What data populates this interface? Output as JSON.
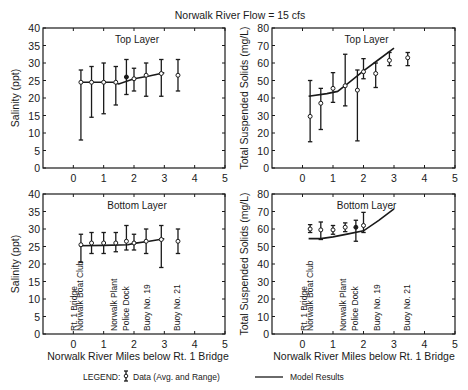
{
  "figure": {
    "title": "Norwalk River Flow = 15 cfs",
    "xlabel": "Norwalk River Miles below Rt. 1 Bridge",
    "legend": {
      "label": "LEGEND:",
      "data_label": "Data (Avg. and Range)",
      "model_label": "Model Results"
    },
    "location_labels": [
      {
        "text": "Rt. 1 Bridge",
        "x": 0.0
      },
      {
        "text": "Norwalk Boat Club",
        "x": 0.2
      },
      {
        "text": "Norwalk Plant",
        "x": 1.3
      },
      {
        "text": "Police Dock",
        "x": 1.7
      },
      {
        "text": "Buoy No. 19",
        "x": 2.4
      },
      {
        "text": "Buoy No. 21",
        "x": 3.4
      }
    ]
  },
  "chart_data": [
    {
      "id": "top-salinity",
      "type": "line",
      "title": "Top Layer",
      "xlabel": "",
      "ylabel": "Salinity (ppt)",
      "xlim": [
        -1,
        5
      ],
      "ylim": [
        0,
        40
      ],
      "xticks": [
        0,
        1,
        2,
        3,
        4,
        5
      ],
      "yticks": [
        0,
        5,
        10,
        15,
        20,
        25,
        30,
        35,
        40
      ],
      "series": [
        {
          "name": "Data (Avg. and Range)",
          "kind": "errorbar",
          "points": [
            {
              "x": 0.25,
              "avg": 24.5,
              "min": 8.0,
              "max": 28.0
            },
            {
              "x": 0.6,
              "avg": 24.5,
              "min": 14.5,
              "max": 29.0
            },
            {
              "x": 1.0,
              "avg": 24.5,
              "min": 15.5,
              "max": 30.0
            },
            {
              "x": 1.4,
              "avg": 24.5,
              "min": 18.0,
              "max": 29.0
            },
            {
              "x": 1.75,
              "avg": 26.0,
              "min": 21.0,
              "max": 31.0,
              "filled": true
            },
            {
              "x": 2.0,
              "avg": 25.5,
              "min": 22.0,
              "max": 28.5
            },
            {
              "x": 2.4,
              "avg": 26.5,
              "min": 20.5,
              "max": 30.0
            },
            {
              "x": 2.9,
              "avg": 27.0,
              "min": 20.5,
              "max": 31.0
            },
            {
              "x": 3.45,
              "avg": 26.5,
              "min": 22.0,
              "max": 31.0
            }
          ]
        },
        {
          "name": "Model Results",
          "kind": "line",
          "x": [
            0.2,
            1.3,
            1.5,
            2.0,
            2.5,
            3.0
          ],
          "y": [
            24.5,
            24.5,
            24.0,
            25.5,
            26.3,
            27.2
          ]
        }
      ]
    },
    {
      "id": "top-tss",
      "type": "line",
      "title": "Top Layer",
      "xlabel": "",
      "ylabel": "Total Suspended Solids (mg/L)",
      "xlim": [
        -1,
        5
      ],
      "ylim": [
        0,
        80
      ],
      "xticks": [
        0,
        1,
        2,
        3,
        4,
        5
      ],
      "yticks": [
        0,
        10,
        20,
        30,
        40,
        50,
        60,
        70,
        80
      ],
      "series": [
        {
          "name": "Data (Avg. and Range)",
          "kind": "errorbar",
          "points": [
            {
              "x": 0.25,
              "avg": 29.5,
              "min": 15.0,
              "max": 50.0
            },
            {
              "x": 0.6,
              "avg": 37.0,
              "min": 22.0,
              "max": 45.5
            },
            {
              "x": 1.0,
              "avg": 45.5,
              "min": 37.5,
              "max": 54.5
            },
            {
              "x": 1.4,
              "avg": 47.0,
              "min": 35.5,
              "max": 65.0
            },
            {
              "x": 1.8,
              "avg": 44.5,
              "min": 15.5,
              "max": 56.0
            },
            {
              "x": 2.0,
              "avg": 55.0,
              "min": 51.0,
              "max": 62.5
            },
            {
              "x": 2.4,
              "avg": 54.0,
              "min": 46.0,
              "max": 60.0
            },
            {
              "x": 2.85,
              "avg": 61.5,
              "min": 58.5,
              "max": 66.0
            },
            {
              "x": 3.45,
              "avg": 63.0,
              "min": 58.5,
              "max": 66.0
            }
          ]
        },
        {
          "name": "Model Results",
          "kind": "line",
          "x": [
            0.2,
            0.8,
            1.15,
            1.5,
            2.0,
            2.5,
            3.0
          ],
          "y": [
            41.0,
            42.5,
            43.8,
            48.5,
            55.5,
            62.0,
            68.5
          ]
        }
      ]
    },
    {
      "id": "bottom-salinity",
      "type": "line",
      "title": "Bottom Layer",
      "xlabel": "Norwalk River Miles below Rt. 1 Bridge",
      "ylabel": "Salinity (ppt)",
      "xlim": [
        -1,
        5
      ],
      "ylim": [
        0,
        40
      ],
      "xticks": [
        0,
        1,
        2,
        3,
        4,
        5
      ],
      "yticks": [
        0,
        5,
        10,
        15,
        20,
        25,
        30,
        35,
        40
      ],
      "series": [
        {
          "name": "Data (Avg. and Range)",
          "kind": "errorbar",
          "points": [
            {
              "x": 0.25,
              "avg": 25.5,
              "min": 20.5,
              "max": 28.5
            },
            {
              "x": 0.6,
              "avg": 26.0,
              "min": 23.0,
              "max": 29.0
            },
            {
              "x": 1.0,
              "avg": 26.0,
              "min": 23.0,
              "max": 29.0
            },
            {
              "x": 1.4,
              "avg": 26.0,
              "min": 23.5,
              "max": 29.0
            },
            {
              "x": 1.75,
              "avg": 26.5,
              "min": 24.0,
              "max": 31.0
            },
            {
              "x": 2.0,
              "avg": 26.0,
              "min": 24.0,
              "max": 28.5
            },
            {
              "x": 2.4,
              "avg": 26.5,
              "min": 23.0,
              "max": 30.0
            },
            {
              "x": 2.9,
              "avg": 27.0,
              "min": 19.0,
              "max": 31.0
            },
            {
              "x": 3.45,
              "avg": 26.5,
              "min": 23.0,
              "max": 30.0
            }
          ]
        },
        {
          "name": "Model Results",
          "kind": "line",
          "x": [
            0.2,
            1.0,
            1.8,
            2.0,
            2.5,
            3.0
          ],
          "y": [
            25.2,
            25.3,
            25.5,
            25.9,
            26.5,
            27.2
          ]
        }
      ]
    },
    {
      "id": "bottom-tss",
      "type": "line",
      "title": "Bottom Layer",
      "xlabel": "Norwalk River Miles below Rt. 1 Bridge",
      "ylabel": "Total Suspended Solids (mg/L)",
      "xlim": [
        -1,
        5
      ],
      "ylim": [
        0,
        80
      ],
      "xticks": [
        0,
        1,
        2,
        3,
        4,
        5
      ],
      "yticks": [
        0,
        10,
        20,
        30,
        40,
        50,
        60,
        70,
        80
      ],
      "series": [
        {
          "name": "Data (Avg. and Range)",
          "kind": "errorbar",
          "points": [
            {
              "x": 0.25,
              "avg": 60.0,
              "min": 58.0,
              "max": 62.5
            },
            {
              "x": 0.6,
              "avg": 59.5,
              "min": 54.0,
              "max": 64.0
            },
            {
              "x": 1.0,
              "avg": 59.5,
              "min": 57.0,
              "max": 62.0
            },
            {
              "x": 1.4,
              "avg": 61.0,
              "min": 58.5,
              "max": 63.5
            },
            {
              "x": 1.75,
              "avg": 61.0,
              "min": 53.0,
              "max": 65.0,
              "filled": true
            },
            {
              "x": 2.0,
              "avg": 62.0,
              "min": 58.0,
              "max": 69.5
            }
          ]
        },
        {
          "name": "Model Results",
          "kind": "line",
          "x": [
            0.2,
            0.6,
            1.0,
            1.5,
            2.0,
            2.5,
            3.0
          ],
          "y": [
            54.5,
            54.5,
            55.5,
            57.2,
            59.0,
            65.0,
            71.5
          ]
        }
      ]
    }
  ]
}
